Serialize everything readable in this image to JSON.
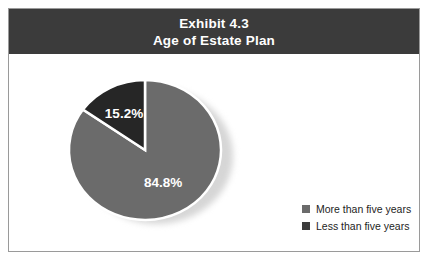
{
  "figure": {
    "header": {
      "line1": "Exhibit 4.3",
      "line2": "Age of Estate Plan",
      "background_color": "#3b3b3b",
      "text_color": "#ffffff"
    },
    "border_color": "#9a9a9a",
    "background_color": "#ffffff"
  },
  "chart_data": {
    "type": "pie",
    "title": "Exhibit 4.3 Age of Estate Plan",
    "subtitle": "Age of Estate Plan",
    "categories": [
      "More than five years",
      "Less than five years"
    ],
    "values": [
      84.8,
      15.2
    ],
    "value_labels": [
      "84.8%",
      "15.2%"
    ],
    "value_unit": "%",
    "colors": [
      "#6b6b6b",
      "#262626"
    ],
    "separator_color": "#ffffff",
    "shadow_color": "#d6d6d6",
    "label_color": "#ffffff",
    "legend_position": "right",
    "grid": false,
    "xlabel": "",
    "ylabel": ""
  },
  "legend": {
    "items": [
      {
        "label": "More than five years",
        "color": "#6b6b6b"
      },
      {
        "label": "Less than five years",
        "color": "#3c3c3c"
      }
    ]
  }
}
